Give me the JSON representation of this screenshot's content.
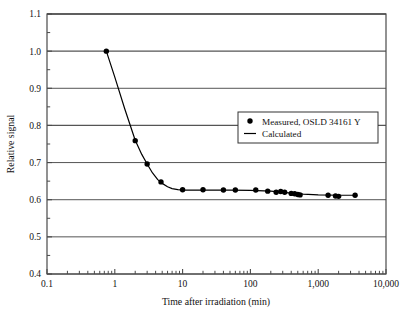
{
  "chart_data": {
    "type": "scatter",
    "title": "",
    "xlabel": "Time after irradiation (min)",
    "ylabel": "Relative signal",
    "xscale": "log",
    "yscale": "linear",
    "xlim": [
      0.1,
      10000
    ],
    "ylim": [
      0.4,
      1.1
    ],
    "grid": "horizontal",
    "legend_position": "upper-right-inside",
    "xticks": [
      0.1,
      1,
      10,
      100,
      1000,
      10000
    ],
    "xtick_labels": [
      "0.1",
      "1",
      "10",
      "100",
      "1,000",
      "10,000"
    ],
    "yticks": [
      0.4,
      0.5,
      0.6,
      0.7,
      0.8,
      0.9,
      1.0,
      1.1
    ],
    "ytick_labels": [
      "0.4",
      "0.5",
      "0.6",
      "0.7",
      "0.8",
      "0.9",
      "1.0",
      "1.1"
    ],
    "yminor_step": 0.05,
    "series": [
      {
        "name": "Measured, OSLD 34161 Y",
        "marker": "filled-circle",
        "color": "#000000",
        "points": [
          {
            "x": 0.75,
            "y": 1.0
          },
          {
            "x": 2.0,
            "y": 0.759
          },
          {
            "x": 3.0,
            "y": 0.696
          },
          {
            "x": 4.8,
            "y": 0.648
          },
          {
            "x": 10.0,
            "y": 0.627
          },
          {
            "x": 20.0,
            "y": 0.627
          },
          {
            "x": 40.0,
            "y": 0.626
          },
          {
            "x": 60.0,
            "y": 0.626
          },
          {
            "x": 120.0,
            "y": 0.626
          },
          {
            "x": 180.0,
            "y": 0.623
          },
          {
            "x": 240.0,
            "y": 0.62
          },
          {
            "x": 280.0,
            "y": 0.622
          },
          {
            "x": 320.0,
            "y": 0.62
          },
          {
            "x": 400.0,
            "y": 0.617
          },
          {
            "x": 450.0,
            "y": 0.616
          },
          {
            "x": 500.0,
            "y": 0.614
          },
          {
            "x": 540.0,
            "y": 0.613
          },
          {
            "x": 1400.0,
            "y": 0.612
          },
          {
            "x": 1800.0,
            "y": 0.61
          },
          {
            "x": 2000.0,
            "y": 0.609
          },
          {
            "x": 3500.0,
            "y": 0.612
          }
        ]
      },
      {
        "name": "Calculated",
        "marker": "line",
        "color": "#000000",
        "points": [
          {
            "x": 0.75,
            "y": 1.0
          },
          {
            "x": 1.0,
            "y": 0.93
          },
          {
            "x": 1.4,
            "y": 0.845
          },
          {
            "x": 2.0,
            "y": 0.76
          },
          {
            "x": 2.5,
            "y": 0.722
          },
          {
            "x": 3.0,
            "y": 0.696
          },
          {
            "x": 3.6,
            "y": 0.672
          },
          {
            "x": 4.3,
            "y": 0.654
          },
          {
            "x": 5.0,
            "y": 0.644
          },
          {
            "x": 6.0,
            "y": 0.635
          },
          {
            "x": 7.0,
            "y": 0.63
          },
          {
            "x": 8.5,
            "y": 0.627
          },
          {
            "x": 10.0,
            "y": 0.626
          },
          {
            "x": 20.0,
            "y": 0.626
          },
          {
            "x": 50.0,
            "y": 0.626
          },
          {
            "x": 100.0,
            "y": 0.625
          },
          {
            "x": 200.0,
            "y": 0.623
          },
          {
            "x": 400.0,
            "y": 0.618
          },
          {
            "x": 600.0,
            "y": 0.615
          },
          {
            "x": 1000.0,
            "y": 0.613
          },
          {
            "x": 2000.0,
            "y": 0.612
          },
          {
            "x": 3700.0,
            "y": 0.612
          }
        ]
      }
    ]
  },
  "legend": {
    "entries": [
      {
        "label": "Measured, OSLD 34161 Y",
        "marker": "filled-circle"
      },
      {
        "label": "Calculated",
        "marker": "line"
      }
    ]
  },
  "colors": {
    "axis": "#4a4a4a",
    "grid": "#555555",
    "data": "#000000",
    "background": "#ffffff"
  }
}
